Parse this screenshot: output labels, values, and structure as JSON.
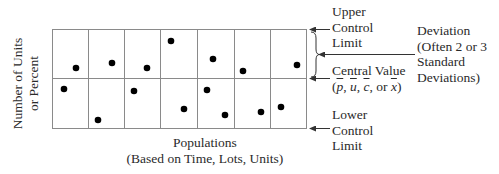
{
  "diagram": {
    "type": "control-chart",
    "y_axis_label": {
      "line1": "Number of Units",
      "line2": "or Percent"
    },
    "x_axis_label": {
      "line1": "Populations",
      "line2": "(Based on Time, Lots, Units)"
    },
    "upper_control_limit": {
      "line1": "Upper",
      "line2": "Control",
      "line3": "Limit"
    },
    "central_value": {
      "line1": "Central Value",
      "symbols_open": "(",
      "sym_p": "p",
      "sep1": ", ",
      "sym_u": "u",
      "sep2": ", ",
      "sym_c": "c",
      "sep3": ", or ",
      "sym_x": "x",
      "symbols_close": ")"
    },
    "lower_control_limit": {
      "line1": "Lower",
      "line2": "Control",
      "line3": "Limit"
    },
    "deviation": {
      "line1": "Deviation",
      "line2": "(Often 2 or 3",
      "line3": "Standard",
      "line4": "Deviations)"
    },
    "columns": 7,
    "colors": {
      "grid": "#8a8a8a",
      "dot": "#000000",
      "text": "#2a2a2a",
      "arrow": "#333333"
    },
    "points": [
      {
        "x": 64,
        "y": 89
      },
      {
        "x": 76,
        "y": 68
      },
      {
        "x": 98,
        "y": 120
      },
      {
        "x": 112,
        "y": 63
      },
      {
        "x": 134,
        "y": 91
      },
      {
        "x": 147,
        "y": 68
      },
      {
        "x": 171,
        "y": 41
      },
      {
        "x": 184,
        "y": 109
      },
      {
        "x": 207,
        "y": 90
      },
      {
        "x": 213,
        "y": 59
      },
      {
        "x": 225,
        "y": 115
      },
      {
        "x": 243,
        "y": 71
      },
      {
        "x": 261,
        "y": 112
      },
      {
        "x": 281,
        "y": 107
      },
      {
        "x": 297,
        "y": 65
      }
    ]
  }
}
